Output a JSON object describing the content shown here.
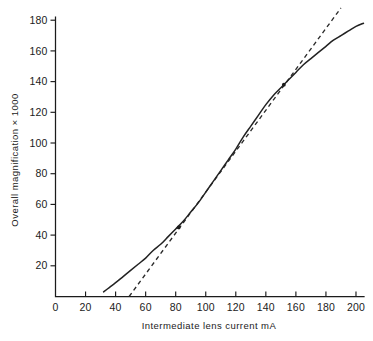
{
  "chart_data": {
    "type": "line",
    "title": "",
    "xlabel": "Intermediate lens current  mA",
    "ylabel": "Overall magnification × 1000",
    "xlim": [
      0,
      205
    ],
    "ylim": [
      0,
      186
    ],
    "grid": false,
    "legend": "none",
    "xticks": [
      0,
      20,
      40,
      60,
      80,
      100,
      120,
      140,
      160,
      180,
      200
    ],
    "xtick_labels": [
      "0",
      "20",
      "40",
      "60",
      "80",
      "100",
      "120",
      "140",
      "160",
      "180",
      "200"
    ],
    "yticks": [
      20,
      40,
      60,
      80,
      100,
      120,
      140,
      160,
      180
    ],
    "ytick_labels": [
      "20",
      "40",
      "60",
      "80",
      "100",
      "120",
      "140",
      "160",
      "180"
    ],
    "series": [
      {
        "name": "Overall magnification curve",
        "style": "solid",
        "color": "#222222",
        "x": [
          32,
          36,
          40,
          45,
          50,
          55,
          60,
          65,
          70,
          75,
          80,
          85,
          90,
          95,
          100,
          105,
          110,
          115,
          120,
          125,
          130,
          135,
          140,
          145,
          150,
          155,
          160,
          165,
          170,
          175,
          180,
          185,
          190,
          195,
          200,
          205
        ],
        "y": [
          3,
          6,
          9,
          13,
          17,
          21,
          25,
          30,
          34,
          39,
          44,
          49,
          55,
          61,
          68,
          75,
          82,
          89,
          96,
          104,
          111,
          118,
          125,
          131,
          136,
          141,
          146,
          151,
          155,
          159,
          163,
          167,
          170,
          173,
          176,
          178
        ]
      },
      {
        "name": "Tangent to linear region",
        "style": "dashed",
        "color": "#2a2a2a",
        "x": [
          49,
          205
        ],
        "y": [
          0,
          208
        ],
        "touch_points": [
          {
            "x": 82,
            "y": 45
          },
          {
            "x": 152,
            "y": 138
          }
        ]
      }
    ],
    "annotations": [
      {
        "label": "lower-tangency-point",
        "x": 82,
        "y": 45
      },
      {
        "label": "upper-tangency-point",
        "x": 152,
        "y": 138
      }
    ]
  },
  "axes": {
    "x_title": "Intermediate lens current  mA",
    "y_title": "Overall magnification × 1000",
    "x_tick_labels": [
      "0",
      "20",
      "40",
      "60",
      "80",
      "100",
      "120",
      "140",
      "160",
      "180",
      "200"
    ],
    "y_tick_labels": [
      "180",
      "160",
      "140",
      "120",
      "100",
      "80",
      "60",
      "40",
      "20"
    ]
  },
  "colors": {
    "background": "#ffffff",
    "axis": "#1b1b1b",
    "curve": "#222222",
    "tangent": "#2a2a2a"
  }
}
